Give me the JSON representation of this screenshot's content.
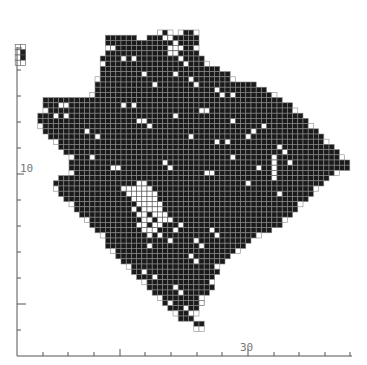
{
  "chart_data": {
    "type": "heatmap",
    "title": "",
    "xlabel": "",
    "ylabel": "",
    "grid": {
      "origin_x": 17,
      "origin_y": 30,
      "cell": 5.2
    },
    "x_axis": {
      "line": {
        "x1": 17,
        "x2": 352,
        "y": 356
      },
      "ticks": [
        {
          "x": 43,
          "len": 4
        },
        {
          "x": 68,
          "len": 4
        },
        {
          "x": 94,
          "len": 4
        },
        {
          "x": 120,
          "len": 7
        },
        {
          "x": 145,
          "len": 4
        },
        {
          "x": 171,
          "len": 4
        },
        {
          "x": 197,
          "len": 4
        },
        {
          "x": 222,
          "len": 4
        },
        {
          "x": 248,
          "len": 7
        },
        {
          "x": 274,
          "len": 4
        },
        {
          "x": 299,
          "len": 4
        },
        {
          "x": 325,
          "len": 4
        },
        {
          "x": 350,
          "len": 4
        }
      ],
      "tick_labels": [
        {
          "text": "30",
          "x": 240,
          "y": 351
        }
      ]
    },
    "y_axis": {
      "line": {
        "x": 17,
        "y1": 47,
        "y2": 356
      },
      "ticks": [
        {
          "y": 48,
          "len": 5
        },
        {
          "y": 70,
          "len": 4
        },
        {
          "y": 96,
          "len": 4
        },
        {
          "y": 122,
          "len": 4
        },
        {
          "y": 148,
          "len": 4
        },
        {
          "y": 174,
          "len": 7
        },
        {
          "y": 200,
          "len": 4
        },
        {
          "y": 226,
          "len": 4
        },
        {
          "y": 252,
          "len": 4
        },
        {
          "y": 278,
          "len": 4
        },
        {
          "y": 304,
          "len": 9
        },
        {
          "y": 330,
          "len": 4
        }
      ],
      "tick_labels": [
        {
          "text": "10",
          "x": 20,
          "y": 172
        }
      ]
    },
    "inset": {
      "col": 1,
      "row": 3,
      "cols": 2,
      "rows": 4,
      "filled": [
        [
          1,
          2
        ],
        [
          1,
          1
        ]
      ]
    },
    "rows": [
      {
        "r": 0,
        "spans": [
          [
            27,
            29
          ],
          [
            31,
            34
          ]
        ]
      },
      {
        "r": 1,
        "spans": [
          [
            17,
            22
          ],
          [
            25,
            34
          ]
        ]
      },
      {
        "r": 2,
        "spans": [
          [
            17,
            34
          ]
        ]
      },
      {
        "r": 3,
        "spans": [
          [
            17,
            34
          ]
        ]
      },
      {
        "r": 4,
        "spans": [
          [
            17,
            34
          ]
        ]
      },
      {
        "r": 5,
        "spans": [
          [
            16,
            35
          ]
        ]
      },
      {
        "r": 6,
        "spans": [
          [
            16,
            36
          ]
        ]
      },
      {
        "r": 7,
        "spans": [
          [
            16,
            38
          ]
        ]
      },
      {
        "r": 8,
        "spans": [
          [
            16,
            40
          ]
        ]
      },
      {
        "r": 9,
        "spans": [
          [
            15,
            41
          ]
        ]
      },
      {
        "r": 10,
        "spans": [
          [
            15,
            45
          ]
        ]
      },
      {
        "r": 11,
        "spans": [
          [
            15,
            47
          ]
        ]
      },
      {
        "r": 12,
        "spans": [
          [
            14,
            49
          ]
        ]
      },
      {
        "r": 13,
        "spans": [
          [
            5,
            13
          ],
          [
            14,
            50
          ]
        ]
      },
      {
        "r": 14,
        "spans": [
          [
            5,
            52
          ]
        ]
      },
      {
        "r": 15,
        "spans": [
          [
            5,
            53
          ]
        ]
      },
      {
        "r": 16,
        "spans": [
          [
            4,
            54
          ]
        ]
      },
      {
        "r": 17,
        "spans": [
          [
            4,
            55
          ]
        ]
      },
      {
        "r": 18,
        "spans": [
          [
            4,
            56
          ]
        ]
      },
      {
        "r": 19,
        "spans": [
          [
            5,
            57
          ]
        ]
      },
      {
        "r": 20,
        "spans": [
          [
            6,
            58
          ]
        ]
      },
      {
        "r": 21,
        "spans": [
          [
            7,
            59
          ]
        ]
      },
      {
        "r": 22,
        "spans": [
          [
            8,
            60
          ]
        ]
      },
      {
        "r": 23,
        "spans": [
          [
            9,
            61
          ]
        ]
      },
      {
        "r": 24,
        "spans": [
          [
            10,
            62
          ]
        ]
      },
      {
        "r": 25,
        "spans": [
          [
            10,
            63
          ]
        ]
      },
      {
        "r": 26,
        "spans": [
          [
            10,
            63
          ]
        ]
      },
      {
        "r": 27,
        "spans": [
          [
            10,
            61
          ]
        ]
      },
      {
        "r": 28,
        "spans": [
          [
            8,
            59
          ]
        ]
      },
      {
        "r": 29,
        "spans": [
          [
            7,
            58
          ]
        ]
      },
      {
        "r": 30,
        "spans": [
          [
            7,
            57
          ]
        ]
      },
      {
        "r": 31,
        "spans": [
          [
            8,
            56
          ]
        ]
      },
      {
        "r": 32,
        "spans": [
          [
            9,
            55
          ]
        ]
      },
      {
        "r": 33,
        "spans": [
          [
            10,
            54
          ]
        ]
      },
      {
        "r": 34,
        "spans": [
          [
            11,
            53
          ]
        ]
      },
      {
        "r": 35,
        "spans": [
          [
            12,
            52
          ]
        ]
      },
      {
        "r": 36,
        "spans": [
          [
            13,
            51
          ]
        ]
      },
      {
        "r": 37,
        "spans": [
          [
            14,
            50
          ]
        ]
      },
      {
        "r": 38,
        "spans": [
          [
            15,
            48
          ]
        ]
      },
      {
        "r": 39,
        "spans": [
          [
            16,
            46
          ]
        ]
      },
      {
        "r": 40,
        "spans": [
          [
            17,
            44
          ]
        ]
      },
      {
        "r": 41,
        "spans": [
          [
            17,
            43
          ]
        ]
      },
      {
        "r": 42,
        "spans": [
          [
            18,
            42
          ]
        ]
      },
      {
        "r": 43,
        "spans": [
          [
            19,
            40
          ]
        ]
      },
      {
        "r": 44,
        "spans": [
          [
            20,
            39
          ]
        ]
      },
      {
        "r": 45,
        "spans": [
          [
            21,
            38
          ]
        ]
      },
      {
        "r": 46,
        "spans": [
          [
            22,
            38
          ]
        ]
      },
      {
        "r": 47,
        "spans": [
          [
            23,
            37
          ]
        ]
      },
      {
        "r": 48,
        "spans": [
          [
            24,
            37
          ]
        ]
      },
      {
        "r": 49,
        "spans": [
          [
            25,
            37
          ]
        ]
      },
      {
        "r": 50,
        "spans": [
          [
            26,
            36
          ]
        ]
      },
      {
        "r": 51,
        "spans": [
          [
            27,
            35
          ]
        ]
      },
      {
        "r": 52,
        "spans": [
          [
            28,
            35
          ]
        ]
      },
      {
        "r": 53,
        "spans": [
          [
            29,
            34
          ]
        ]
      },
      {
        "r": 54,
        "spans": [
          [
            30,
            34
          ]
        ]
      },
      {
        "r": 55,
        "spans": [
          [
            31,
            33
          ]
        ]
      },
      {
        "r": 56,
        "spans": [
          [
            34,
            35
          ]
        ]
      },
      {
        "r": 57,
        "spans": [
          [
            34,
            35
          ]
        ]
      }
    ],
    "holes": [
      [
        28,
        1
      ],
      [
        29,
        1
      ],
      [
        30,
        2
      ],
      [
        29,
        3
      ],
      [
        30,
        3
      ],
      [
        31,
        3
      ],
      [
        18,
        3
      ],
      [
        20,
        5
      ],
      [
        22,
        5
      ],
      [
        29,
        4
      ],
      [
        30,
        4
      ],
      [
        31,
        5
      ],
      [
        32,
        6
      ],
      [
        24,
        8
      ],
      [
        30,
        8
      ],
      [
        33,
        9
      ],
      [
        34,
        10
      ],
      [
        26,
        10
      ],
      [
        38,
        11
      ],
      [
        39,
        12
      ],
      [
        41,
        12
      ],
      [
        20,
        14
      ],
      [
        22,
        14
      ],
      [
        8,
        14
      ],
      [
        9,
        14
      ],
      [
        7,
        16
      ],
      [
        9,
        16
      ],
      [
        35,
        15
      ],
      [
        36,
        15
      ],
      [
        30,
        16
      ],
      [
        41,
        17
      ],
      [
        45,
        19
      ],
      [
        47,
        18
      ],
      [
        44,
        20
      ],
      [
        23,
        17
      ],
      [
        24,
        17
      ],
      [
        25,
        18
      ],
      [
        13,
        19
      ],
      [
        15,
        20
      ],
      [
        33,
        20
      ],
      [
        38,
        21
      ],
      [
        40,
        21
      ],
      [
        50,
        22
      ],
      [
        51,
        23
      ],
      [
        49,
        24
      ],
      [
        49,
        25
      ],
      [
        49,
        26
      ],
      [
        49,
        27
      ],
      [
        49,
        28
      ],
      [
        46,
        26
      ],
      [
        52,
        25
      ],
      [
        14,
        24
      ],
      [
        18,
        26
      ],
      [
        19,
        26
      ],
      [
        28,
        25
      ],
      [
        29,
        26
      ],
      [
        41,
        24
      ],
      [
        36,
        27
      ],
      [
        37,
        27
      ],
      [
        50,
        31
      ],
      [
        44,
        29
      ],
      [
        23,
        29
      ],
      [
        24,
        29
      ],
      [
        20,
        30
      ],
      [
        21,
        30
      ],
      [
        22,
        30
      ],
      [
        23,
        30
      ],
      [
        24,
        30
      ],
      [
        25,
        30
      ],
      [
        21,
        31
      ],
      [
        22,
        31
      ],
      [
        23,
        31
      ],
      [
        24,
        31
      ],
      [
        25,
        31
      ],
      [
        26,
        31
      ],
      [
        22,
        32
      ],
      [
        23,
        32
      ],
      [
        24,
        32
      ],
      [
        25,
        32
      ],
      [
        26,
        32
      ],
      [
        23,
        33
      ],
      [
        24,
        33
      ],
      [
        25,
        33
      ],
      [
        26,
        33
      ],
      [
        27,
        33
      ],
      [
        22,
        34
      ],
      [
        24,
        34
      ],
      [
        25,
        34
      ],
      [
        26,
        34
      ],
      [
        27,
        34
      ],
      [
        23,
        35
      ],
      [
        24,
        35
      ],
      [
        26,
        35
      ],
      [
        27,
        35
      ],
      [
        28,
        35
      ],
      [
        24,
        36
      ],
      [
        25,
        36
      ],
      [
        27,
        36
      ],
      [
        28,
        36
      ],
      [
        23,
        37
      ],
      [
        24,
        37
      ],
      [
        26,
        37
      ],
      [
        27,
        37
      ],
      [
        24,
        38
      ],
      [
        25,
        38
      ],
      [
        26,
        38
      ],
      [
        25,
        39
      ],
      [
        27,
        39
      ],
      [
        29,
        36
      ],
      [
        30,
        38
      ],
      [
        31,
        37
      ],
      [
        25,
        41
      ],
      [
        29,
        40
      ],
      [
        34,
        40
      ],
      [
        35,
        41
      ],
      [
        37,
        38
      ],
      [
        38,
        39
      ],
      [
        33,
        43
      ],
      [
        34,
        44
      ],
      [
        21,
        46
      ],
      [
        22,
        47
      ],
      [
        24,
        46
      ],
      [
        26,
        47
      ],
      [
        30,
        49
      ],
      [
        31,
        50
      ],
      [
        29,
        52
      ],
      [
        32,
        53
      ],
      [
        33,
        54
      ],
      [
        35,
        52
      ]
    ]
  }
}
